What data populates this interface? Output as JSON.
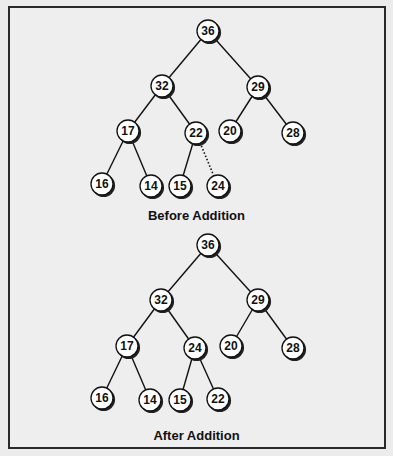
{
  "figure": {
    "before": {
      "caption": "Before Addition",
      "nodes": [
        {
          "id": "n36",
          "value": "36",
          "x": 208,
          "y": 31
        },
        {
          "id": "n32",
          "value": "32",
          "x": 162,
          "y": 86
        },
        {
          "id": "n29",
          "value": "29",
          "x": 258,
          "y": 87
        },
        {
          "id": "n17",
          "value": "17",
          "x": 128,
          "y": 131
        },
        {
          "id": "n22",
          "value": "22",
          "x": 196,
          "y": 133
        },
        {
          "id": "n20",
          "value": "20",
          "x": 230,
          "y": 131
        },
        {
          "id": "n28",
          "value": "28",
          "x": 293,
          "y": 133
        },
        {
          "id": "n16",
          "value": "16",
          "x": 102,
          "y": 184
        },
        {
          "id": "n14",
          "value": "14",
          "x": 151,
          "y": 186
        },
        {
          "id": "n15",
          "value": "15",
          "x": 180,
          "y": 186
        },
        {
          "id": "n24",
          "value": "24",
          "x": 218,
          "y": 186
        }
      ],
      "edges": [
        {
          "from": "n36",
          "to": "n32",
          "style": "solid"
        },
        {
          "from": "n36",
          "to": "n29",
          "style": "solid"
        },
        {
          "from": "n32",
          "to": "n17",
          "style": "solid"
        },
        {
          "from": "n32",
          "to": "n22",
          "style": "solid"
        },
        {
          "from": "n29",
          "to": "n20",
          "style": "solid"
        },
        {
          "from": "n29",
          "to": "n28",
          "style": "solid"
        },
        {
          "from": "n17",
          "to": "n16",
          "style": "solid"
        },
        {
          "from": "n17",
          "to": "n14",
          "style": "solid"
        },
        {
          "from": "n22",
          "to": "n15",
          "style": "solid"
        },
        {
          "from": "n22",
          "to": "n24",
          "style": "dotted"
        }
      ]
    },
    "after": {
      "caption": "After Addition",
      "nodes": [
        {
          "id": "m36",
          "value": "36",
          "x": 208,
          "y": 245
        },
        {
          "id": "m32",
          "value": "32",
          "x": 161,
          "y": 300
        },
        {
          "id": "m29",
          "value": "29",
          "x": 258,
          "y": 300
        },
        {
          "id": "m17",
          "value": "17",
          "x": 127,
          "y": 346
        },
        {
          "id": "m24",
          "value": "24",
          "x": 195,
          "y": 348
        },
        {
          "id": "m20",
          "value": "20",
          "x": 231,
          "y": 346
        },
        {
          "id": "m28",
          "value": "28",
          "x": 293,
          "y": 348
        },
        {
          "id": "m16",
          "value": "16",
          "x": 102,
          "y": 398
        },
        {
          "id": "m14",
          "value": "14",
          "x": 150,
          "y": 400
        },
        {
          "id": "m15",
          "value": "15",
          "x": 180,
          "y": 400
        },
        {
          "id": "m22",
          "value": "22",
          "x": 218,
          "y": 399
        }
      ],
      "edges": [
        {
          "from": "m36",
          "to": "m32",
          "style": "solid"
        },
        {
          "from": "m36",
          "to": "m29",
          "style": "solid"
        },
        {
          "from": "m32",
          "to": "m17",
          "style": "solid"
        },
        {
          "from": "m32",
          "to": "m24",
          "style": "solid"
        },
        {
          "from": "m29",
          "to": "m20",
          "style": "solid"
        },
        {
          "from": "m29",
          "to": "m28",
          "style": "solid"
        },
        {
          "from": "m17",
          "to": "m16",
          "style": "solid"
        },
        {
          "from": "m17",
          "to": "m14",
          "style": "solid"
        },
        {
          "from": "m24",
          "to": "m15",
          "style": "solid"
        },
        {
          "from": "m24",
          "to": "m22",
          "style": "solid"
        }
      ]
    },
    "colors": {
      "node_fill": "#ffffff",
      "node_stroke": "#111111",
      "node_shadow": "#222222",
      "edge": "#111111",
      "frame_border": "#2a2a2a",
      "background": "#eeeeee"
    }
  }
}
